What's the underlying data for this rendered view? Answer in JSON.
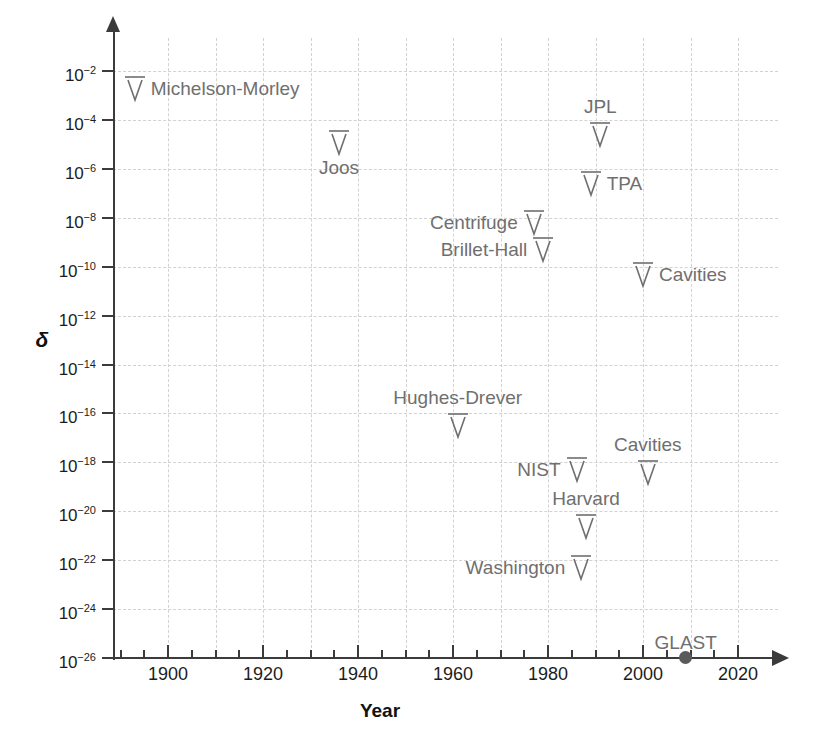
{
  "chart_data": {
    "type": "scatter",
    "title": "",
    "xlabel": "Year",
    "ylabel": "δ",
    "xlim": [
      1890,
      2023
    ],
    "ylim_exponent": [
      -26,
      -2
    ],
    "yscale": "log",
    "grid": true,
    "legend": "none",
    "xticks": [
      1900,
      1920,
      1940,
      1960,
      1980,
      2000,
      2020
    ],
    "xtick_labels": [
      "1900",
      "1920",
      "1940",
      "1960",
      "1980",
      "2000",
      "2020"
    ],
    "xminor_step": 5,
    "ytick_exponents": [
      -2,
      -4,
      -6,
      -8,
      -10,
      -12,
      -14,
      -16,
      -18,
      -20,
      -22,
      -24,
      -26
    ],
    "ytick_labels": [
      "10⁻²",
      "10⁻⁴",
      "10⁻⁶",
      "10⁻⁸",
      "10⁻¹⁰",
      "10⁻¹²",
      "10⁻¹⁴",
      "10⁻¹⁶",
      "10⁻¹⁸",
      "10⁻²⁰",
      "10⁻²²",
      "10⁻²⁴",
      "10⁻²⁶"
    ],
    "marker_note": "downward open arrows denote upper limits; filled dot denotes a measured point",
    "points": [
      {
        "label": "Michelson-Morley",
        "year": 1893,
        "exponent": -2.2,
        "marker": "upper-limit-arrow",
        "label_pos": "right"
      },
      {
        "label": "Joos",
        "year": 1936,
        "exponent": -4.4,
        "marker": "upper-limit-arrow",
        "label_pos": "below"
      },
      {
        "label": "Centrifuge",
        "year": 1977,
        "exponent": -7.7,
        "marker": "upper-limit-arrow",
        "label_pos": "left"
      },
      {
        "label": "Brillet-Hall",
        "year": 1979,
        "exponent": -8.8,
        "marker": "upper-limit-arrow",
        "label_pos": "left"
      },
      {
        "label": "JPL",
        "year": 1991,
        "exponent": -4.1,
        "marker": "upper-limit-arrow",
        "label_pos": "above"
      },
      {
        "label": "TPA",
        "year": 1989,
        "exponent": -6.1,
        "marker": "upper-limit-arrow",
        "label_pos": "right"
      },
      {
        "label": "Cavities",
        "year": 2000,
        "exponent": -9.8,
        "marker": "upper-limit-arrow",
        "label_pos": "right"
      },
      {
        "label": "Hughes-Drever",
        "year": 1961,
        "exponent": -16.0,
        "marker": "upper-limit-arrow",
        "label_pos": "above"
      },
      {
        "label": "NIST",
        "year": 1986,
        "exponent": -17.8,
        "marker": "upper-limit-arrow",
        "label_pos": "left"
      },
      {
        "label": "Cavities",
        "year": 2001,
        "exponent": -17.9,
        "marker": "upper-limit-arrow",
        "label_pos": "above"
      },
      {
        "label": "Harvard",
        "year": 1988,
        "exponent": -20.1,
        "marker": "upper-limit-arrow",
        "label_pos": "above"
      },
      {
        "label": "Washington",
        "year": 1987,
        "exponent": -21.8,
        "marker": "upper-limit-arrow",
        "label_pos": "left"
      },
      {
        "label": "GLAST",
        "year": 2009,
        "exponent": -26.0,
        "marker": "filled-dot",
        "label_pos": "above"
      }
    ]
  },
  "style": {
    "axis_color": "#3b3b3b",
    "grid_color": "#d2d2d2",
    "marker_color": "#6f6f6f",
    "label_color": "#6f6f6f",
    "tick_label_color": "#1c1c1c",
    "background": "#ffffff"
  }
}
